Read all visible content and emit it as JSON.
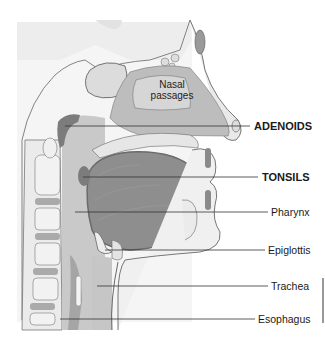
{
  "diagram": {
    "colors": {
      "background": "#ffffff",
      "head_backdrop": "#e6e6e6",
      "soft_tissue": "#cfcfcf",
      "tissue_mid": "#bdbdbd",
      "airway": "#c4c4c4",
      "tongue": "#8e8e8e",
      "tongue_edge": "#6f6f6f",
      "lymphoid": "#7c7c7c",
      "bone": "#ececec",
      "outline": "#555555",
      "leader_line": "#333333",
      "label_text": "#1a1a1a"
    },
    "inner_label": {
      "line1": "Nasal",
      "line2": "passages"
    },
    "labels": [
      {
        "id": "adenoids",
        "text": "ADENOIDS",
        "bold": true,
        "y": 126,
        "line_start_x": 65,
        "line_end_x": 250,
        "text_x": 254
      },
      {
        "id": "tonsils",
        "text": "TONSILS",
        "bold": true,
        "y": 177,
        "line_start_x": 83,
        "line_end_x": 258,
        "text_x": 262
      },
      {
        "id": "pharynx",
        "text": "Pharynx",
        "bold": false,
        "y": 212,
        "line_start_x": 75,
        "line_end_x": 268,
        "text_x": 271
      },
      {
        "id": "epiglottis",
        "text": "Epiglottis",
        "bold": false,
        "y": 250,
        "line_start_x": 105,
        "line_end_x": 265,
        "text_x": 268
      },
      {
        "id": "trachea",
        "text": "Trachea",
        "bold": false,
        "y": 286,
        "line_start_x": 97,
        "line_end_x": 268,
        "text_x": 271
      },
      {
        "id": "esophagus",
        "text": "Esophagus",
        "bold": false,
        "y": 319,
        "line_start_x": 60,
        "line_end_x": 255,
        "text_x": 258
      }
    ]
  }
}
